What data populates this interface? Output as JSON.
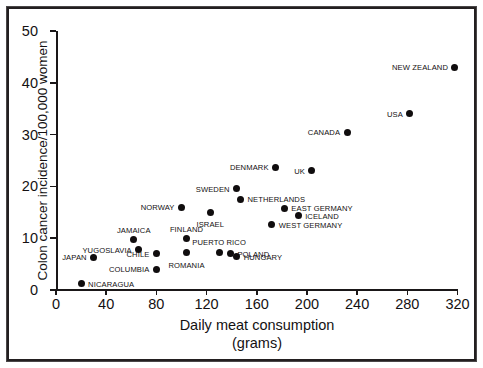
{
  "chart_data": {
    "type": "scatter",
    "title": "",
    "xlabel": "Daily meat consumption (grams)",
    "xlabel_line1": "Daily meat consumption",
    "xlabel_line2": "(grams)",
    "ylabel": "Colon cancer incidence/100,000 women",
    "xlim": [
      0,
      320
    ],
    "ylim": [
      0,
      50
    ],
    "xticks": [
      "0",
      "40",
      "80",
      "120",
      "160",
      "200",
      "240",
      "280",
      "320"
    ],
    "yticks": [
      "0",
      "10",
      "20",
      "30",
      "40",
      "50"
    ],
    "grid": false,
    "legend": "none",
    "marker": "filled-circle",
    "marker_color": "#100d0e",
    "points": [
      {
        "label": "NICARAGUA",
        "x": 20,
        "y": 1.2,
        "label_pos": "right"
      },
      {
        "label": "JAPAN",
        "x": 30,
        "y": 6.3,
        "label_pos": "left"
      },
      {
        "label": "COLUMBIA",
        "x": 80,
        "y": 4.0,
        "label_pos": "left"
      },
      {
        "label": "JAMAICA",
        "x": 62,
        "y": 9.7,
        "label_pos": "above"
      },
      {
        "label": "YUGOSLAVIA",
        "x": 66,
        "y": 7.8,
        "label_pos": "left"
      },
      {
        "label": "CHILE",
        "x": 80,
        "y": 7.0,
        "label_pos": "left"
      },
      {
        "label": "FINLAND",
        "x": 104,
        "y": 9.9,
        "label_pos": "above"
      },
      {
        "label": "ROMANIA",
        "x": 104,
        "y": 7.2,
        "label_pos": "below"
      },
      {
        "label": "NORWAY",
        "x": 100,
        "y": 16.0,
        "label_pos": "left"
      },
      {
        "label": "ISRAEL",
        "x": 123,
        "y": 15.0,
        "label_pos": "below"
      },
      {
        "label": "PUERTO RICO",
        "x": 130,
        "y": 7.3,
        "label_pos": "above"
      },
      {
        "label": "POLAND",
        "x": 139,
        "y": 7.0,
        "label_pos": "right"
      },
      {
        "label": "HUNGARY",
        "x": 144,
        "y": 6.4,
        "label_pos": "right"
      },
      {
        "label": "SWEDEN",
        "x": 144,
        "y": 19.5,
        "label_pos": "left"
      },
      {
        "label": "NETHERLANDS",
        "x": 147,
        "y": 17.5,
        "label_pos": "right"
      },
      {
        "label": "DENMARK",
        "x": 175,
        "y": 23.7,
        "label_pos": "left"
      },
      {
        "label": "WEST GERMANY",
        "x": 172,
        "y": 12.6,
        "label_pos": "right"
      },
      {
        "label": "EAST GERMANY",
        "x": 182,
        "y": 15.8,
        "label_pos": "right"
      },
      {
        "label": "ICELAND",
        "x": 193,
        "y": 14.3,
        "label_pos": "right"
      },
      {
        "label": "UK",
        "x": 204,
        "y": 23.0,
        "label_pos": "left"
      },
      {
        "label": "CANADA",
        "x": 232,
        "y": 30.5,
        "label_pos": "left"
      },
      {
        "label": "USA",
        "x": 282,
        "y": 34.0,
        "label_pos": "left"
      },
      {
        "label": "NEW ZEALAND",
        "x": 318,
        "y": 43.0,
        "label_pos": "left"
      }
    ]
  }
}
